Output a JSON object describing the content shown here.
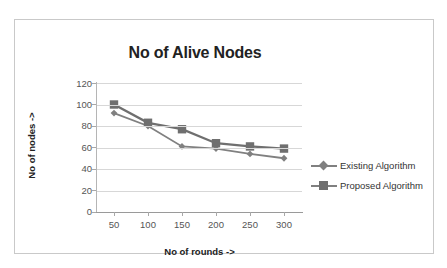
{
  "chart_data": {
    "type": "line",
    "title": "No of Alive Nodes",
    "xlabel": "No of rounds ->",
    "ylabel": "No of nodes ->",
    "categories": [
      50,
      100,
      150,
      200,
      250,
      300
    ],
    "xticklabels": [
      "50",
      "100",
      "150",
      "200",
      "250",
      "300"
    ],
    "yticklabels": [
      "0",
      "20",
      "40",
      "60",
      "80",
      "100",
      "120"
    ],
    "yticks": [
      0,
      20,
      40,
      60,
      80,
      100,
      120
    ],
    "ylim": [
      0,
      120
    ],
    "grid": "horizontal",
    "legend_position": "right",
    "series": [
      {
        "name": "Existing Algorithm",
        "marker": "diamond",
        "color": "#808080",
        "values": [
          92,
          80,
          61,
          59,
          54,
          50
        ]
      },
      {
        "name": "Proposed Algorithm",
        "marker": "square",
        "color": "#6f6f6f",
        "values": [
          100,
          83,
          77,
          64,
          61,
          59
        ]
      }
    ]
  },
  "legend": {
    "items": [
      {
        "label": "Existing Algorithm"
      },
      {
        "label": "Proposed Algorithm"
      }
    ]
  },
  "colors": {
    "series_existing": "#808080",
    "series_proposed": "#6f6f6f",
    "gridline": "#d7d7d7",
    "border": "#c9c9c9",
    "text": "#222222",
    "tick_text": "#555555"
  }
}
